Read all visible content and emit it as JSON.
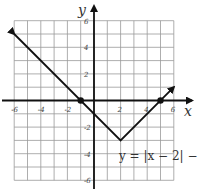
{
  "chart_data": {
    "type": "line",
    "title": "",
    "xlabel": "x",
    "ylabel": "y",
    "xlim": [
      -6.5,
      7
    ],
    "ylim": [
      -6.5,
      7
    ],
    "grid": true,
    "x_ticks": [
      -6,
      -4,
      -2,
      2,
      4,
      6
    ],
    "y_ticks": [
      6,
      4,
      2,
      -2,
      -4,
      -6
    ],
    "x_tick_labels": [
      "-6",
      "-4",
      "-2",
      "2",
      "4",
      "6"
    ],
    "y_tick_labels": [
      "6",
      "4",
      "2",
      "-2",
      "-4",
      "-6"
    ],
    "series": [
      {
        "name": "y = |x − 2| − 3",
        "x": [
          -6,
          2,
          6
        ],
        "y": [
          5,
          -3,
          1
        ],
        "arrows": "both_ends"
      }
    ],
    "points": [
      {
        "x": -1,
        "y": 0,
        "label": "x-intercept"
      },
      {
        "x": 5,
        "y": 0,
        "label": "x-intercept"
      }
    ],
    "annotations": [
      {
        "text": "y = |x − 2| − 3",
        "x": 4,
        "y": -4
      }
    ]
  },
  "labels": {
    "x_axis": "x",
    "y_axis": "y",
    "equation": "y = |x − 2| − 3",
    "ticks_x": [
      "-6",
      "-4",
      "-2",
      "2",
      "4",
      "6"
    ],
    "ticks_y": [
      "6",
      "4",
      "2",
      "-2",
      "-4",
      "-6"
    ]
  }
}
